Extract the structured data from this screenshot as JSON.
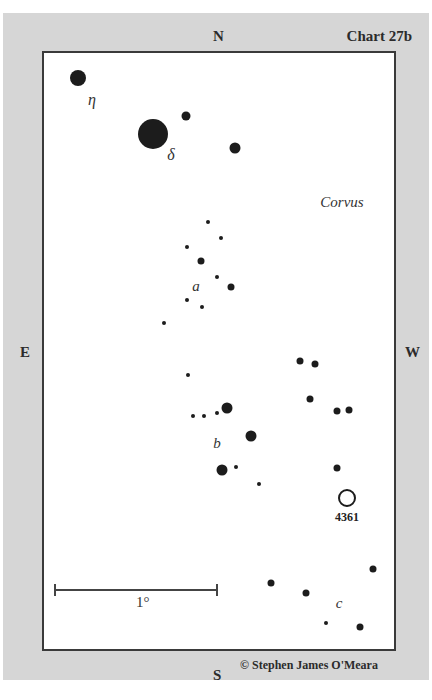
{
  "chart": {
    "title": "Chart 27b",
    "constellation": "Corvus",
    "credit": "© Stephen James O'Meara",
    "compass": {
      "north": "N",
      "south": "S",
      "east": "E",
      "west": "W"
    },
    "scale_label": "1°",
    "object": {
      "label": "4361",
      "type": "planetary-nebula"
    },
    "star_labels": {
      "eta": "η",
      "delta": "δ",
      "a": "a",
      "b": "b",
      "c": "c"
    }
  },
  "stars": [
    {
      "x": 78,
      "y": 78,
      "size": 16
    },
    {
      "x": 153,
      "y": 134,
      "size": 30
    },
    {
      "x": 186,
      "y": 116,
      "size": 9
    },
    {
      "x": 235,
      "y": 148,
      "size": 11
    },
    {
      "x": 208,
      "y": 222,
      "size": 4
    },
    {
      "x": 221,
      "y": 238,
      "size": 4
    },
    {
      "x": 187,
      "y": 247,
      "size": 4
    },
    {
      "x": 201,
      "y": 261,
      "size": 7
    },
    {
      "x": 217,
      "y": 277,
      "size": 4
    },
    {
      "x": 231,
      "y": 287,
      "size": 7
    },
    {
      "x": 187,
      "y": 300,
      "size": 4
    },
    {
      "x": 202,
      "y": 307,
      "size": 4
    },
    {
      "x": 164,
      "y": 323,
      "size": 4
    },
    {
      "x": 300,
      "y": 361,
      "size": 7
    },
    {
      "x": 315,
      "y": 364,
      "size": 7
    },
    {
      "x": 188,
      "y": 375,
      "size": 4
    },
    {
      "x": 310,
      "y": 399,
      "size": 7
    },
    {
      "x": 227,
      "y": 408,
      "size": 11
    },
    {
      "x": 337,
      "y": 411,
      "size": 7
    },
    {
      "x": 349,
      "y": 410,
      "size": 7
    },
    {
      "x": 193,
      "y": 416,
      "size": 4
    },
    {
      "x": 204,
      "y": 416,
      "size": 4
    },
    {
      "x": 217,
      "y": 413,
      "size": 4
    },
    {
      "x": 251,
      "y": 436,
      "size": 11
    },
    {
      "x": 222,
      "y": 470,
      "size": 11
    },
    {
      "x": 236,
      "y": 467,
      "size": 4
    },
    {
      "x": 337,
      "y": 468,
      "size": 7
    },
    {
      "x": 259,
      "y": 484,
      "size": 4
    },
    {
      "x": 373,
      "y": 569,
      "size": 7
    },
    {
      "x": 271,
      "y": 583,
      "size": 7
    },
    {
      "x": 306,
      "y": 593,
      "size": 7
    },
    {
      "x": 326,
      "y": 623,
      "size": 4
    },
    {
      "x": 360,
      "y": 627,
      "size": 7
    }
  ]
}
